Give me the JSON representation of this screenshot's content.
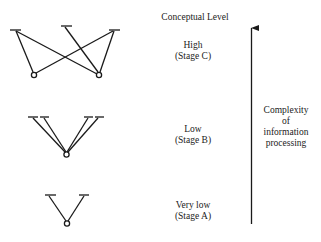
{
  "header": {
    "title": "Conceptual Level"
  },
  "stages": [
    {
      "id": "C",
      "level": "High",
      "stage": "(Stage C)",
      "structure": {
        "nodes": 2,
        "branches": 3,
        "connections": [
          [
            0,
            0
          ],
          [
            0,
            2
          ],
          [
            1,
            0
          ],
          [
            1,
            1
          ],
          [
            1,
            2
          ]
        ]
      }
    },
    {
      "id": "B",
      "level": "Low",
      "stage": "(Stage B)",
      "structure": {
        "nodes": 1,
        "branches": 4,
        "connections": [
          [
            0,
            0
          ],
          [
            0,
            1
          ],
          [
            0,
            2
          ],
          [
            0,
            3
          ]
        ]
      }
    },
    {
      "id": "A",
      "level": "Very low",
      "stage": "(Stage A)",
      "structure": {
        "nodes": 1,
        "branches": 2,
        "connections": [
          [
            0,
            0
          ],
          [
            0,
            1
          ]
        ]
      }
    }
  ],
  "axis": {
    "direction": "up",
    "label_lines": [
      "Complexity",
      "of",
      "information",
      "processing"
    ]
  },
  "colors": {
    "ink": "#1a1a1a",
    "background": "#ffffff"
  }
}
